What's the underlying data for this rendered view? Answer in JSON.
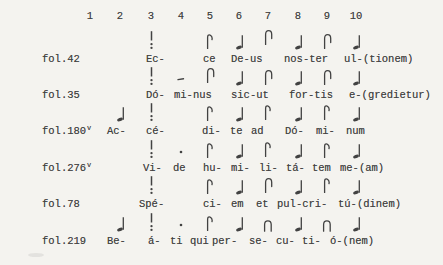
{
  "colors": {
    "bg": "#f4f3ef",
    "ink": "#424242"
  },
  "columns": {
    "labels": [
      "1",
      "2",
      "3",
      "4",
      "5",
      "6",
      "7",
      "8",
      "9",
      "10"
    ],
    "x": [
      90,
      120,
      151,
      181,
      210,
      239,
      268,
      298,
      327,
      356
    ],
    "y": 10
  },
  "rows": [
    {
      "folio": "fol.42",
      "folio_sup": "",
      "y": 53,
      "neumes": [
        {
          "col": 3,
          "glyph": "virga",
          "lift": 0
        },
        {
          "col": 5,
          "glyph": "pes",
          "lift": 1
        },
        {
          "col": 6,
          "glyph": "note",
          "lift": 0
        },
        {
          "col": 7,
          "glyph": "clivis",
          "lift": 5
        },
        {
          "col": 8,
          "glyph": "note",
          "lift": 0
        },
        {
          "col": 9,
          "glyph": "clivis",
          "lift": 1
        },
        {
          "col": 10,
          "glyph": "note",
          "lift": 0
        }
      ],
      "syllables": [
        {
          "x": 146,
          "text": "Ec-"
        },
        {
          "x": 203,
          "text": "ce"
        },
        {
          "x": 231,
          "text": "De-us"
        },
        {
          "x": 284,
          "text": "nos-ter"
        },
        {
          "x": 344,
          "text": "ul-(tionem)"
        }
      ]
    },
    {
      "folio": "fol.35",
      "folio_sup": "",
      "y": 89,
      "neumes": [
        {
          "col": 3,
          "glyph": "virga",
          "lift": 0
        },
        {
          "col": 4,
          "glyph": "dash",
          "lift": 5
        },
        {
          "col": 5,
          "glyph": "clivis",
          "lift": 3
        },
        {
          "col": 6,
          "glyph": "note",
          "lift": 0
        },
        {
          "col": 7,
          "glyph": "clivis",
          "lift": 1
        },
        {
          "col": 8,
          "glyph": "note",
          "lift": 0
        },
        {
          "col": 9,
          "glyph": "clivis",
          "lift": 1
        },
        {
          "col": 10,
          "glyph": "note",
          "lift": 0
        }
      ],
      "syllables": [
        {
          "x": 146,
          "text": "Dó-"
        },
        {
          "x": 174,
          "text": "mi-nus"
        },
        {
          "x": 231,
          "text": "sic-ut"
        },
        {
          "x": 289,
          "text": "for-tis"
        },
        {
          "x": 349,
          "text": "e-(gredietur)"
        }
      ]
    },
    {
      "folio": "fol.180",
      "folio_sup": "v",
      "y": 125,
      "neumes": [
        {
          "col": 2,
          "glyph": "note",
          "lift": 0
        },
        {
          "col": 3,
          "glyph": "virga",
          "lift": 0
        },
        {
          "col": 5,
          "glyph": "pes",
          "lift": 1
        },
        {
          "col": 6,
          "glyph": "note",
          "lift": 0
        },
        {
          "col": 7,
          "glyph": "pes",
          "lift": 2
        },
        {
          "col": 8,
          "glyph": "note",
          "lift": 0
        },
        {
          "col": 9,
          "glyph": "pes",
          "lift": 2
        },
        {
          "col": 10,
          "glyph": "note",
          "lift": 0
        }
      ],
      "syllables": [
        {
          "x": 107,
          "text": "Ac-"
        },
        {
          "x": 146,
          "text": "cé-"
        },
        {
          "x": 202,
          "text": "di-"
        },
        {
          "x": 230,
          "text": "te"
        },
        {
          "x": 251,
          "text": "ad"
        },
        {
          "x": 285,
          "text": "Dó-"
        },
        {
          "x": 316,
          "text": "mi-"
        },
        {
          "x": 346,
          "text": "num"
        }
      ]
    },
    {
      "folio": "fol.276",
      "folio_sup": "v",
      "y": 162,
      "neumes": [
        {
          "col": 3,
          "glyph": "virga",
          "lift": 0
        },
        {
          "col": 4,
          "glyph": "dot",
          "lift": 5
        },
        {
          "col": 5,
          "glyph": "pes",
          "lift": 1
        },
        {
          "col": 6,
          "glyph": "note",
          "lift": 0
        },
        {
          "col": 7,
          "glyph": "pes",
          "lift": 2
        },
        {
          "col": 8,
          "glyph": "note",
          "lift": 0
        },
        {
          "col": 9,
          "glyph": "pes",
          "lift": 1
        },
        {
          "col": 10,
          "glyph": "note",
          "lift": 0
        }
      ],
      "syllables": [
        {
          "x": 143,
          "text": "Vi-"
        },
        {
          "x": 173,
          "text": "de"
        },
        {
          "x": 203,
          "text": "hu-"
        },
        {
          "x": 231,
          "text": "mi-"
        },
        {
          "x": 259,
          "text": "li-"
        },
        {
          "x": 286,
          "text": "tá-"
        },
        {
          "x": 312,
          "text": "tem"
        },
        {
          "x": 340,
          "text": "me-(am)"
        }
      ]
    },
    {
      "folio": "fol.78",
      "folio_sup": "",
      "y": 198,
      "neumes": [
        {
          "col": 3,
          "glyph": "virga",
          "lift": 0
        },
        {
          "col": 5,
          "glyph": "pes",
          "lift": 1
        },
        {
          "col": 6,
          "glyph": "note",
          "lift": 0
        },
        {
          "col": 7,
          "glyph": "clivis",
          "lift": 2
        },
        {
          "col": 8,
          "glyph": "note",
          "lift": 0
        },
        {
          "col": 9,
          "glyph": "pes",
          "lift": 2
        },
        {
          "col": 10,
          "glyph": "note",
          "lift": 0
        }
      ],
      "syllables": [
        {
          "x": 139,
          "text": "Spé-"
        },
        {
          "x": 203,
          "text": "ci-"
        },
        {
          "x": 231,
          "text": "em"
        },
        {
          "x": 256,
          "text": "et"
        },
        {
          "x": 277,
          "text": "pul-cri-"
        },
        {
          "x": 338,
          "text": "tú-(dinem)"
        }
      ]
    },
    {
      "folio": "fol.219",
      "folio_sup": "",
      "y": 235,
      "neumes": [
        {
          "col": 2,
          "glyph": "note",
          "lift": 0
        },
        {
          "col": 3,
          "glyph": "virga",
          "lift": 0
        },
        {
          "col": 4,
          "glyph": "dot",
          "lift": 5
        },
        {
          "col": 5,
          "glyph": "pes",
          "lift": 1
        },
        {
          "col": 6,
          "glyph": "note",
          "lift": 0
        },
        {
          "col": 7,
          "glyph": "arch",
          "lift": 0
        },
        {
          "col": 8,
          "glyph": "note",
          "lift": 0
        },
        {
          "col": 9,
          "glyph": "arch",
          "lift": 0
        },
        {
          "col": 10,
          "glyph": "note",
          "lift": 0
        }
      ],
      "syllables": [
        {
          "x": 107,
          "text": "Be-"
        },
        {
          "x": 148,
          "text": "á-"
        },
        {
          "x": 170,
          "text": "ti"
        },
        {
          "x": 190,
          "text": "qui"
        },
        {
          "x": 212,
          "text": "per-"
        },
        {
          "x": 249,
          "text": "se-"
        },
        {
          "x": 276,
          "text": "cu-"
        },
        {
          "x": 302,
          "text": "ti-"
        },
        {
          "x": 330,
          "text": "ó-(nem)"
        }
      ]
    }
  ]
}
